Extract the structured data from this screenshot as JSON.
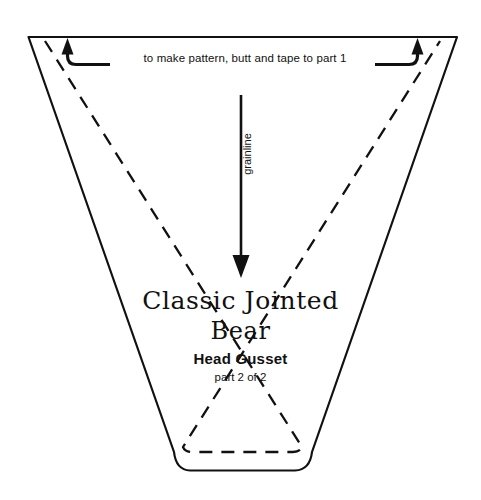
{
  "sheet": {
    "background_color": "#ffffff",
    "ink_color": "#111111"
  },
  "annotations": {
    "tape_note": "to make pattern, butt and tape to part 1",
    "grainline_label": "grainline"
  },
  "title": {
    "line1": "Classic Jointed",
    "line2": "Bear"
  },
  "part": {
    "name": "Head Gusset",
    "count": "part 2 of 2"
  },
  "icons": {
    "left_tape_arrow": "curved-arrow-up-left",
    "right_tape_arrow": "curved-arrow-up-right",
    "grainline_arrow": "arrow-down"
  },
  "shape": {
    "cut_line_style": "solid",
    "seam_line_style": "dashed",
    "stroke_color": "#111111"
  }
}
